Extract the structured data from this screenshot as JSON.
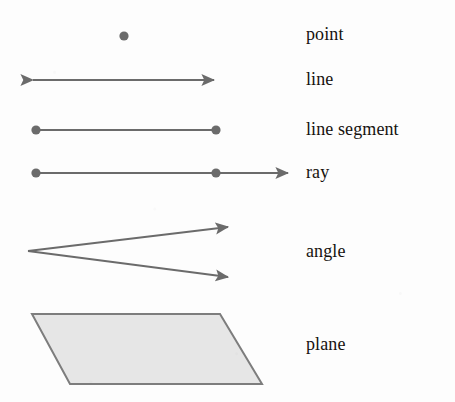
{
  "figure": {
    "background_color": "#fdfdfd",
    "stroke_color": "#6b6b6b",
    "plane_fill_color": "#e6e6e6",
    "plane_border_color": "#7d7d7d",
    "label_color": "#16120f"
  },
  "rows": [
    {
      "id": "point",
      "label": "point",
      "shape": "dot",
      "description": "A single filled dot",
      "geometry": {
        "cx": 124,
        "cy": 36,
        "r": 4.5
      }
    },
    {
      "id": "line",
      "label": "line",
      "shape": "double-arrow",
      "description": "A straight path with arrowheads on both ends",
      "geometry": {
        "x1": 31,
        "y1": 80,
        "x2": 216,
        "y2": 80
      }
    },
    {
      "id": "line-segment",
      "label": "line segment",
      "shape": "segment-with-endpoints",
      "description": "A straight path with a dot at each endpoint",
      "geometry": {
        "x1": 36,
        "y1": 130,
        "x2": 216,
        "y2": 130,
        "endpoint_r": 4.5
      }
    },
    {
      "id": "ray",
      "label": "ray",
      "shape": "ray-with-endpoints",
      "description": "Two dots with the path continuing to an arrowhead on the right",
      "geometry": {
        "x1": 36,
        "y1": 173,
        "x2": 216,
        "y2": 173,
        "tip_x": 290,
        "endpoint_r": 4.5
      }
    },
    {
      "id": "angle",
      "label": "angle",
      "shape": "two-rays-from-vertex",
      "description": "Two rays sharing a common vertex, opening to the right",
      "geometry": {
        "vertex_x": 28,
        "vertex_y": 251,
        "upper_tip_x": 230,
        "upper_tip_y": 227,
        "lower_tip_x": 230,
        "lower_tip_y": 277
      }
    },
    {
      "id": "plane",
      "label": "plane",
      "shape": "parallelogram",
      "description": "A shaded parallelogram representing a flat surface",
      "geometry": {
        "points": [
          [
            32,
            314
          ],
          [
            220,
            314
          ],
          [
            262,
            384
          ],
          [
            70,
            384
          ]
        ]
      }
    }
  ]
}
